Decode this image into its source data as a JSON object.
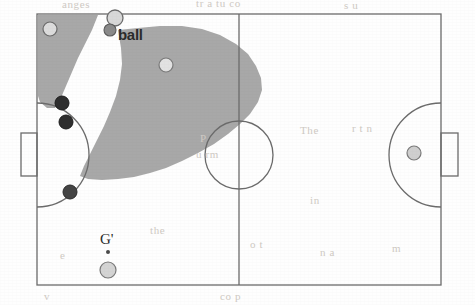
{
  "diagram": {
    "background_color": "#fefefe",
    "line_color": "#6b6b6b",
    "shaded_region_color": "#a8a8a8",
    "field": {
      "left": 37,
      "top": 14,
      "right": 441,
      "bottom": 285
    },
    "labels": {
      "ball_label": "ball",
      "goalkeeper_label": "G'"
    },
    "goals": [
      {
        "name": "left-goal",
        "x": 21,
        "y": 133,
        "width": 16,
        "height": 43
      },
      {
        "name": "right-goal",
        "x": 441,
        "y": 133,
        "width": 17,
        "height": 43
      }
    ],
    "center_circle": {
      "cx": 239,
      "cy": 155,
      "r": 34
    },
    "halfway_line": {
      "x": 239,
      "y1": 14,
      "y2": 285
    },
    "penalty_arcs": [
      {
        "name": "left-penalty-arc",
        "cx": 37,
        "cy": 155,
        "r": 52
      },
      {
        "name": "right-penalty-arc",
        "cx": 441,
        "cy": 155,
        "r": 52
      }
    ],
    "markers": [
      {
        "name": "light-player-top-left",
        "type": "light",
        "cx": 50,
        "cy": 29,
        "r": 7
      },
      {
        "name": "ball-marker",
        "type": "light",
        "cx": 115,
        "cy": 18,
        "r": 8
      },
      {
        "name": "ball-small-marker",
        "type": "mid",
        "cx": 110,
        "cy": 30,
        "r": 6
      },
      {
        "name": "light-player-center-left",
        "type": "light",
        "cx": 166,
        "cy": 65,
        "r": 7
      },
      {
        "name": "dark-player-upper",
        "type": "dark",
        "cx": 62,
        "cy": 103,
        "r": 7
      },
      {
        "name": "dark-player-middle",
        "type": "dark",
        "cx": 66,
        "cy": 122,
        "r": 7
      },
      {
        "name": "dark-player-lower",
        "type": "dark",
        "cx": 70,
        "cy": 192,
        "r": 7
      },
      {
        "name": "goalkeeper-marker",
        "type": "light",
        "cx": 108,
        "cy": 270,
        "r": 8
      },
      {
        "name": "goalkeeper-dot",
        "type": "dot",
        "cx": 108,
        "cy": 252,
        "r": 2
      },
      {
        "name": "right-goalkeeper-marker",
        "type": "light",
        "cx": 414,
        "cy": 153,
        "r": 7
      }
    ],
    "bleed_text": [
      {
        "text": "anges",
        "x": 62,
        "y": 4
      },
      {
        "text": "tr a tu co",
        "x": 196,
        "y": 3
      },
      {
        "text": "s u",
        "x": 344,
        "y": 5
      },
      {
        "text": "The",
        "x": 300,
        "y": 130
      },
      {
        "text": "r t n",
        "x": 352,
        "y": 128
      },
      {
        "text": "P",
        "x": 200,
        "y": 138
      },
      {
        "text": "u rm",
        "x": 196,
        "y": 154
      },
      {
        "text": "in",
        "x": 310,
        "y": 200
      },
      {
        "text": "the",
        "x": 150,
        "y": 230
      },
      {
        "text": "o t",
        "x": 250,
        "y": 244
      },
      {
        "text": "n a",
        "x": 320,
        "y": 252
      },
      {
        "text": "m",
        "x": 392,
        "y": 248
      },
      {
        "text": "e",
        "x": 60,
        "y": 255
      },
      {
        "text": "v",
        "x": 44,
        "y": 296
      },
      {
        "text": "co p",
        "x": 220,
        "y": 296
      }
    ]
  }
}
